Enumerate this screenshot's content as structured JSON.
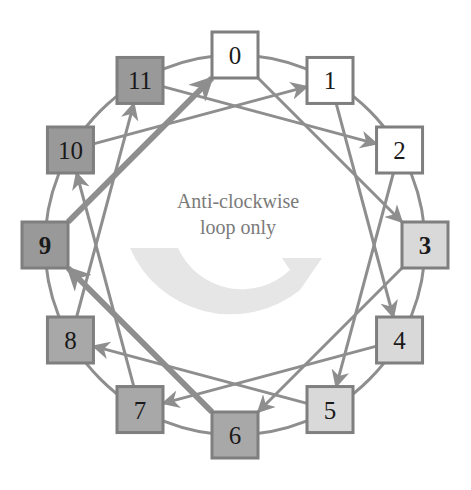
{
  "diagram": {
    "caption_lines": [
      "Anti-clockwise",
      "loop only"
    ],
    "colors": {
      "ring": "#8e8e8e",
      "edge": "#8e8e8e",
      "border": "#7f7f7f",
      "curved_arrow": "#e6e6e6",
      "caption": "#7a7a7a"
    },
    "nodes": [
      {
        "id": 0,
        "label": "0",
        "fill": "#ffffff",
        "bold": false
      },
      {
        "id": 1,
        "label": "1",
        "fill": "#ffffff",
        "bold": false
      },
      {
        "id": 2,
        "label": "2",
        "fill": "#ffffff",
        "bold": false
      },
      {
        "id": 3,
        "label": "3",
        "fill": "#d9d9d9",
        "bold": true
      },
      {
        "id": 4,
        "label": "4",
        "fill": "#d9d9d9",
        "bold": false
      },
      {
        "id": 5,
        "label": "5",
        "fill": "#d9d9d9",
        "bold": false
      },
      {
        "id": 6,
        "label": "6",
        "fill": "#a8a8a8",
        "bold": false
      },
      {
        "id": 7,
        "label": "7",
        "fill": "#a8a8a8",
        "bold": false
      },
      {
        "id": 8,
        "label": "8",
        "fill": "#a8a8a8",
        "bold": false
      },
      {
        "id": 9,
        "label": "9",
        "fill": "#999999",
        "bold": true
      },
      {
        "id": 10,
        "label": "10",
        "fill": "#999999",
        "bold": false
      },
      {
        "id": 11,
        "label": "11",
        "fill": "#999999",
        "bold": false
      }
    ],
    "edges": [
      {
        "from": 0,
        "to": 3,
        "thick": false
      },
      {
        "from": 1,
        "to": 4,
        "thick": false
      },
      {
        "from": 2,
        "to": 5,
        "thick": false
      },
      {
        "from": 3,
        "to": 6,
        "thick": false
      },
      {
        "from": 4,
        "to": 7,
        "thick": false
      },
      {
        "from": 5,
        "to": 8,
        "thick": false
      },
      {
        "from": 6,
        "to": 9,
        "thick": true
      },
      {
        "from": 7,
        "to": 10,
        "thick": false
      },
      {
        "from": 8,
        "to": 11,
        "thick": false
      },
      {
        "from": 9,
        "to": 0,
        "thick": true
      },
      {
        "from": 10,
        "to": 1,
        "thick": false
      },
      {
        "from": 11,
        "to": 2,
        "thick": false
      }
    ]
  }
}
